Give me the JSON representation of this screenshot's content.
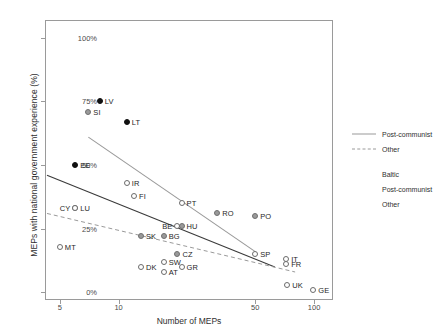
{
  "chart_data": {
    "type": "scatter",
    "title": "",
    "xlabel": "Number of MEPs",
    "ylabel": "MEPs with national government experience (%)",
    "xscale": "log",
    "xticks": [
      5,
      10,
      50,
      100
    ],
    "xtick_labels": [
      "5",
      "10",
      "50",
      "100"
    ],
    "xlim": [
      4.2,
      125
    ],
    "yticks": [
      0,
      25,
      50,
      75,
      100
    ],
    "ytick_labels": [
      "0%",
      "25%",
      "50%",
      "75%",
      "100%"
    ],
    "ylim": [
      -3,
      107
    ],
    "grid": false,
    "legend_position": "right",
    "points": [
      {
        "label": "LV",
        "x": 8,
        "y": 75,
        "group": "Baltic",
        "label_side": "right"
      },
      {
        "label": "SI",
        "x": 7,
        "y": 71,
        "group": "Post-communist",
        "label_side": "right"
      },
      {
        "label": "LT",
        "x": 11,
        "y": 67,
        "group": "Baltic",
        "label_side": "right"
      },
      {
        "label": "EE",
        "x": 6,
        "y": 50,
        "group": "Baltic",
        "label_side": "right"
      },
      {
        "label": "IR",
        "x": 11,
        "y": 43,
        "group": "Other",
        "label_side": "right"
      },
      {
        "label": "FI",
        "x": 12,
        "y": 38,
        "group": "Other",
        "label_side": "right"
      },
      {
        "label": "PT",
        "x": 21,
        "y": 35,
        "group": "Other",
        "label_side": "right"
      },
      {
        "label": "RO",
        "x": 32,
        "y": 31,
        "group": "Post-communist",
        "label_side": "right"
      },
      {
        "label": "PO",
        "x": 50,
        "y": 30,
        "group": "Post-communist",
        "label_side": "right"
      },
      {
        "label": "CY",
        "x": 6,
        "y": 33,
        "group": "Other",
        "label_side": "left"
      },
      {
        "label": "LU",
        "x": 6,
        "y": 33,
        "group": "Other",
        "label_side": "right"
      },
      {
        "label": "BE",
        "x": 20,
        "y": 26,
        "group": "Other",
        "label_side": "left"
      },
      {
        "label": "HU",
        "x": 21,
        "y": 26,
        "group": "Post-communist",
        "label_side": "right"
      },
      {
        "label": "SK",
        "x": 13,
        "y": 22,
        "group": "Post-communist",
        "label_side": "right"
      },
      {
        "label": "BG",
        "x": 17,
        "y": 22,
        "group": "Post-communist",
        "label_side": "right"
      },
      {
        "label": "MT",
        "x": 5,
        "y": 18,
        "group": "Other",
        "label_side": "right"
      },
      {
        "label": "CZ",
        "x": 20,
        "y": 15,
        "group": "Post-communist",
        "label_side": "right"
      },
      {
        "label": "SP",
        "x": 50,
        "y": 15,
        "group": "Other",
        "label_side": "right"
      },
      {
        "label": "SW",
        "x": 17,
        "y": 12,
        "group": "Other",
        "label_side": "right"
      },
      {
        "label": "IT",
        "x": 72,
        "y": 13,
        "group": "Other",
        "label_side": "right"
      },
      {
        "label": "FR",
        "x": 72,
        "y": 11,
        "group": "Other",
        "label_side": "right"
      },
      {
        "label": "GR",
        "x": 21,
        "y": 10,
        "group": "Other",
        "label_side": "right"
      },
      {
        "label": "DK",
        "x": 13,
        "y": 10,
        "group": "Other",
        "label_side": "right"
      },
      {
        "label": "AT",
        "x": 17,
        "y": 8,
        "group": "Other",
        "label_side": "right"
      },
      {
        "label": "UK",
        "x": 73,
        "y": 3,
        "group": "Other",
        "label_side": "right"
      },
      {
        "label": "GE",
        "x": 99,
        "y": 1,
        "group": "Other",
        "label_side": "right"
      }
    ],
    "fit_lines": [
      {
        "name": "Post-communist",
        "style": "solid",
        "color": "#9a9a9a",
        "x1": 7,
        "y1": 61,
        "x2": 50,
        "y2": 16
      },
      {
        "name": "Other-black",
        "style": "solid",
        "color": "#3a3a3a",
        "x1": 4.3,
        "y1": 46,
        "x2": 63,
        "y2": 10
      },
      {
        "name": "Other",
        "style": "dashed",
        "color": "#9a9a9a",
        "x1": 4.3,
        "y1": 31,
        "x2": 80,
        "y2": 8
      }
    ]
  },
  "legend": {
    "lines": [
      {
        "label": "Post-communist",
        "style": "solid"
      },
      {
        "label": "Other",
        "style": "dashed"
      }
    ],
    "markers": [
      {
        "label": "Baltic",
        "group": "Baltic"
      },
      {
        "label": "Post-communist",
        "group": "Post-communist"
      },
      {
        "label": "Other",
        "group": "Other"
      }
    ]
  }
}
